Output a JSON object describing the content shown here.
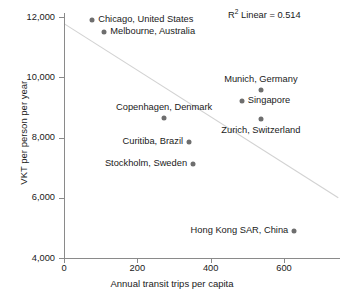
{
  "chart_data": {
    "type": "scatter",
    "title": "",
    "xlabel": "Annual transit trips per capita",
    "ylabel": "VKT per person per year",
    "xlim": [
      0,
      755
    ],
    "ylim": [
      4000,
      12400
    ],
    "xticks": [
      0,
      200,
      400,
      600
    ],
    "xtick_labels": [
      "0",
      "200",
      "400",
      "600"
    ],
    "yticks": [
      4000,
      6000,
      8000,
      10000,
      12000
    ],
    "ytick_labels": [
      "4,000",
      "6,000",
      "8,000",
      "10,000",
      "12,000"
    ],
    "grid": false,
    "legend": null,
    "annotation": "R2 Linear = 0.514",
    "annotation_parts": {
      "symbol": "R",
      "exponent": "2",
      "rest": " Linear = 0.514"
    },
    "r_squared": 0.514,
    "marker_color": "#6e6e6e",
    "fit_line_color": "#d2d2d2",
    "axis_color": "#8a8a8a",
    "fit_line": {
      "x_start": 0,
      "y_start": 11780,
      "x_end": 748,
      "y_end": 6000
    },
    "points": [
      {
        "label": "Chicago, United States",
        "x": 77,
        "y": 11900,
        "label_pos": "right"
      },
      {
        "label": "Melbourne, Australia",
        "x": 110,
        "y": 11500,
        "label_pos": "right"
      },
      {
        "label": "Munich, Germany",
        "x": 537,
        "y": 9565,
        "label_pos": "above"
      },
      {
        "label": "Singapore",
        "x": 485,
        "y": 9200,
        "label_pos": "right"
      },
      {
        "label": "Copenhagen, Denmark",
        "x": 273,
        "y": 8650,
        "label_pos": "above"
      },
      {
        "label": "Zurich, Switzerland",
        "x": 537,
        "y": 8630,
        "label_pos": "below"
      },
      {
        "label": "Curitiba, Brazil",
        "x": 341,
        "y": 7850,
        "label_pos": "left"
      },
      {
        "label": "Stockholm, Sweden",
        "x": 352,
        "y": 7120,
        "label_pos": "left"
      },
      {
        "label": "Hong Kong SAR, China",
        "x": 628,
        "y": 4900,
        "label_pos": "left"
      }
    ]
  }
}
